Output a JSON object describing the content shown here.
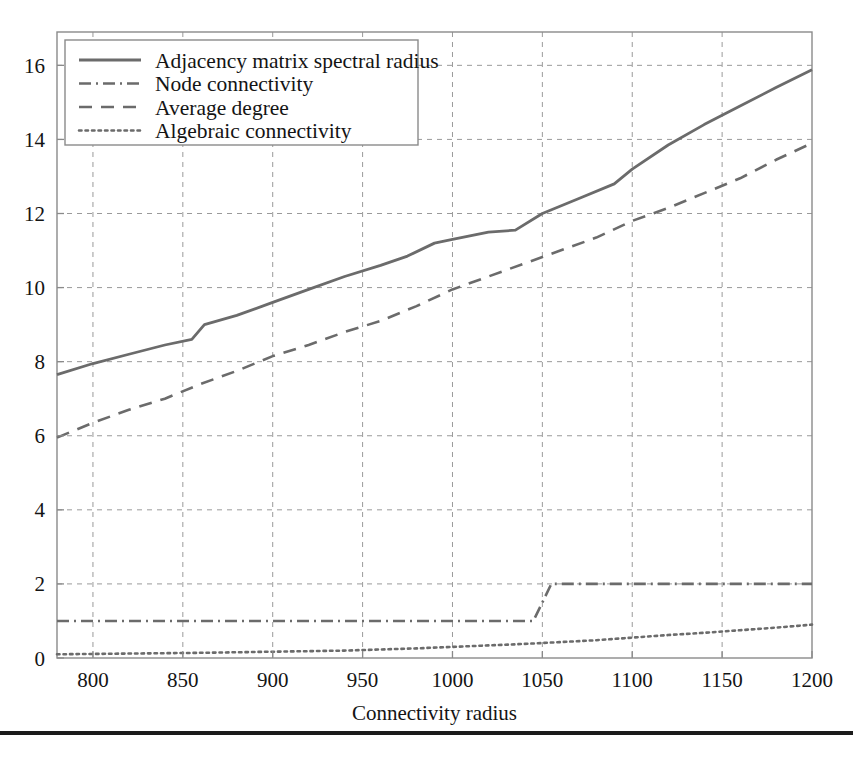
{
  "figure": {
    "background": "#ffffff",
    "line_color": "#6b6b6b",
    "axis_color": "#8a8a8a",
    "grid_color": "#9a9a9a",
    "text_color": "#141414"
  },
  "axes": {
    "x_title": "Connectivity radius",
    "y_title": "",
    "x_ticks": [
      "800",
      "850",
      "900",
      "950",
      "1000",
      "1050",
      "1100",
      "1150",
      "1200"
    ],
    "y_ticks": [
      "0",
      "2",
      "4",
      "6",
      "8",
      "10",
      "12",
      "14",
      "16"
    ]
  },
  "legend": {
    "items": [
      {
        "label": "Adjacency matrix spectral radius",
        "style": "solid"
      },
      {
        "label": "Node connectivity",
        "style": "dashdot"
      },
      {
        "label": "Average degree",
        "style": "dashed"
      },
      {
        "label": "Algebraic connectivity",
        "style": "dotted"
      }
    ]
  },
  "chart_data": {
    "type": "line",
    "title": "",
    "xlabel": "Connectivity radius",
    "ylabel": "",
    "xlim": [
      780,
      1200
    ],
    "ylim": [
      0,
      16.9
    ],
    "xticks": [
      800,
      850,
      900,
      950,
      1000,
      1050,
      1100,
      1150,
      1200
    ],
    "yticks": [
      0,
      2,
      4,
      6,
      8,
      10,
      12,
      14,
      16
    ],
    "grid": true,
    "grid_style": "dashed",
    "legend_position": "upper left",
    "series": [
      {
        "name": "Adjacency matrix spectral radius",
        "style": "solid",
        "x": [
          780,
          800,
          820,
          840,
          855,
          862,
          880,
          900,
          920,
          940,
          960,
          975,
          990,
          1000,
          1020,
          1035,
          1050,
          1070,
          1090,
          1100,
          1120,
          1140,
          1160,
          1180,
          1200
        ],
        "y": [
          7.65,
          7.95,
          8.2,
          8.45,
          8.6,
          9.0,
          9.25,
          9.6,
          9.95,
          10.3,
          10.6,
          10.85,
          11.2,
          11.3,
          11.5,
          11.55,
          12.0,
          12.4,
          12.8,
          13.2,
          13.85,
          14.4,
          14.9,
          15.4,
          15.88
        ]
      },
      {
        "name": "Node connectivity",
        "style": "dashdot",
        "x": [
          780,
          900,
          1000,
          1040,
          1045,
          1055,
          1100,
          1200
        ],
        "y": [
          1,
          1,
          1,
          1,
          1,
          2,
          2,
          2
        ]
      },
      {
        "name": "Average degree",
        "style": "dashed",
        "x": [
          780,
          800,
          820,
          840,
          860,
          880,
          900,
          920,
          940,
          960,
          980,
          1000,
          1020,
          1040,
          1060,
          1080,
          1100,
          1120,
          1140,
          1160,
          1180,
          1200
        ],
        "y": [
          5.95,
          6.35,
          6.7,
          7.0,
          7.4,
          7.75,
          8.15,
          8.45,
          8.8,
          9.1,
          9.5,
          9.95,
          10.3,
          10.65,
          11.0,
          11.35,
          11.8,
          12.15,
          12.55,
          12.95,
          13.45,
          13.9
        ]
      },
      {
        "name": "Algebraic connectivity",
        "style": "dotted",
        "x": [
          780,
          820,
          860,
          900,
          940,
          980,
          1000,
          1040,
          1080,
          1100,
          1120,
          1140,
          1160,
          1180,
          1200
        ],
        "y": [
          0.1,
          0.12,
          0.14,
          0.17,
          0.2,
          0.26,
          0.3,
          0.38,
          0.48,
          0.55,
          0.62,
          0.68,
          0.75,
          0.82,
          0.9
        ]
      }
    ]
  }
}
